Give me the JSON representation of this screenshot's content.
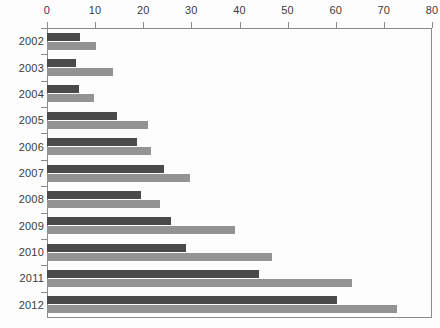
{
  "chart_data": {
    "type": "bar",
    "orientation": "horizontal",
    "title": "",
    "subtitle": "",
    "xlabel": "",
    "ylabel": "",
    "xlim": [
      0,
      80
    ],
    "ylim": null,
    "grid": false,
    "legend": null,
    "legend_position": "none",
    "xticks": [
      0,
      10,
      20,
      30,
      40,
      50,
      60,
      70,
      80
    ],
    "xtick_labels": [
      "0",
      "10",
      "20",
      "30",
      "40",
      "50",
      "60",
      "70",
      "80"
    ],
    "categories": [
      "2002",
      "2003",
      "2004",
      "2005",
      "2006",
      "2007",
      "2008",
      "2009",
      "2010",
      "2011",
      "2012"
    ],
    "series": [
      {
        "name": "series-1",
        "color": "#4a4a4a",
        "values": [
          6.8,
          6.1,
          6.7,
          14.6,
          18.8,
          24.3,
          19.6,
          25.7,
          28.9,
          44.1,
          60.2
        ]
      },
      {
        "name": "series-2",
        "color": "#939393",
        "values": [
          10.2,
          13.7,
          9.8,
          20.9,
          21.7,
          29.8,
          23.5,
          39.0,
          46.7,
          63.3,
          72.8
        ]
      }
    ]
  },
  "axes": {
    "axis_color": "#8a8a8a",
    "tick_label_color": "#3b3b3b"
  }
}
